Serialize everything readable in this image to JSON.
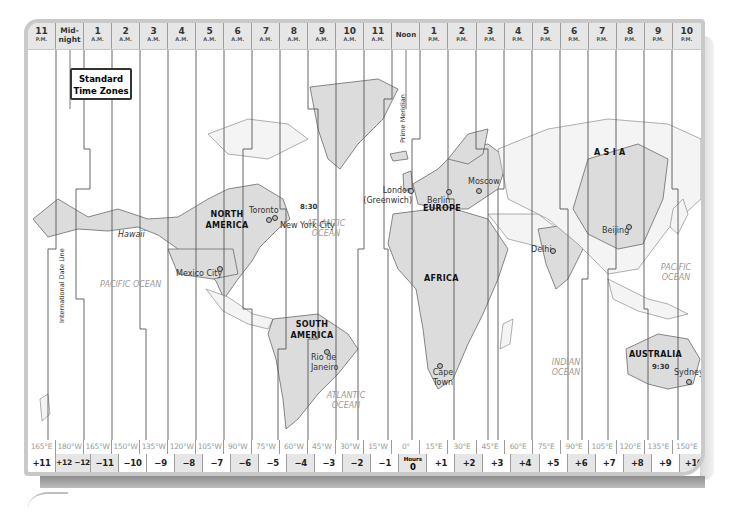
{
  "title": {
    "line1": "Standard",
    "line2": "Time Zones"
  },
  "time_header": [
    {
      "hour": "11",
      "period": "P.M."
    },
    {
      "hour": "Mid-night",
      "period": ""
    },
    {
      "hour": "1",
      "period": "A.M."
    },
    {
      "hour": "2",
      "period": "A.M."
    },
    {
      "hour": "3",
      "period": "A.M."
    },
    {
      "hour": "4",
      "period": "A.M."
    },
    {
      "hour": "5",
      "period": "A.M."
    },
    {
      "hour": "6",
      "period": "A.M."
    },
    {
      "hour": "7",
      "period": "A.M."
    },
    {
      "hour": "8",
      "period": "A.M."
    },
    {
      "hour": "9",
      "period": "A.M."
    },
    {
      "hour": "10",
      "period": "A.M."
    },
    {
      "hour": "11",
      "period": "A.M."
    },
    {
      "hour": "Noon",
      "period": ""
    },
    {
      "hour": "1",
      "period": "P.M."
    },
    {
      "hour": "2",
      "period": "P.M."
    },
    {
      "hour": "3",
      "period": "P.M."
    },
    {
      "hour": "4",
      "period": "P.M."
    },
    {
      "hour": "5",
      "period": "P.M."
    },
    {
      "hour": "6",
      "period": "P.M."
    },
    {
      "hour": "7",
      "period": "P.M."
    },
    {
      "hour": "8",
      "period": "P.M."
    },
    {
      "hour": "9",
      "period": "P.M."
    },
    {
      "hour": "10",
      "period": "P.M."
    }
  ],
  "longitudes": [
    "165°E",
    "180°W",
    "165°W",
    "150°W",
    "135°W",
    "120°W",
    "105°W",
    "90°W",
    "75°W",
    "60°W",
    "45°W",
    "30°W",
    "15°W",
    "0°",
    "15°E",
    "30°E",
    "45°E",
    "60°E",
    "75°E",
    "90°E",
    "105°E",
    "120°E",
    "135°E",
    "150°E"
  ],
  "offsets": [
    "+11",
    "+12 −12",
    "−11",
    "−10",
    "−9",
    "−8",
    "−7",
    "−6",
    "−5",
    "−4",
    "−3",
    "−2",
    "−1",
    "0",
    "+1",
    "+2",
    "+3",
    "+4",
    "+5",
    "+6",
    "+7",
    "+8",
    "+9",
    "+10"
  ],
  "hours_label": "Hours",
  "reference_lines": {
    "date_line": "International Date Line",
    "prime_meridian": "Prime Meridian"
  },
  "regions": {
    "north_america": "NORTH AMERICA",
    "south_america": "SOUTH AMERICA",
    "europe": "EUROPE",
    "africa": "AFRICA",
    "asia": "A S I A",
    "australia": "AUSTRALIA"
  },
  "oceans": {
    "pacific_west": "PACIFIC OCEAN",
    "atlantic_north": "ATLANTIC OCEAN",
    "atlantic_south": "ATLANTIC OCEAN",
    "indian": "INDIAN OCEAN",
    "pacific_east": "PACIFIC OCEAN"
  },
  "cities": {
    "hawaii": "Hawaii",
    "toronto": "Toronto",
    "new_york": "New York City",
    "mexico_city": "Mexico City",
    "rio": "Rio de Janeiro",
    "london": "London (Greenwich)",
    "berlin": "Berlin",
    "moscow": "Moscow",
    "delhi": "Delhi",
    "beijing": "Beijing",
    "cape_town": "Cape Town",
    "sydney": "Sydney"
  },
  "special_offsets": {
    "newfoundland": "8:30",
    "central_australia": "9:30"
  },
  "colors": {
    "land": "#dcdcdc",
    "frame": "#c9c9c9",
    "header_bg": "#e6e6e6"
  }
}
